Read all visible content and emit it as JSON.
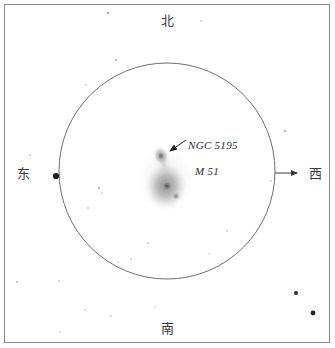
{
  "sketch": {
    "title": "M 51 telescopic field sketch",
    "directions": {
      "north": "北",
      "south": "南",
      "east": "东",
      "west": "西"
    },
    "objects": {
      "companion_label": "NGC 5195",
      "primary_label": "M 51"
    },
    "colors": {
      "frame": "#8a8a8a",
      "field_circle": "#6f6f6f",
      "ink": "#2b2b2b",
      "label": "#3a3a3a",
      "star": "#111111",
      "nebulosity": "#9a9a9a",
      "background": "#ffffff"
    },
    "field_circle": {
      "center_x": 167,
      "center_y": 171,
      "radius": 108
    },
    "drift_arrow": {
      "x_start": 275,
      "x_end": 300,
      "y": 173,
      "points_to": "西"
    },
    "leader_arrow": {
      "x_start": 186,
      "y_start": 140,
      "x_end": 168,
      "y_end": 153
    },
    "galaxy": {
      "primary": {
        "cx": 166,
        "cy": 186,
        "rx": 21,
        "ry": 24
      },
      "nucleus": {
        "cx": 167,
        "cy": 186,
        "r": 5
      },
      "arm_knot": {
        "cx": 176,
        "cy": 196,
        "r": 4
      },
      "bridge": {
        "cx": 164,
        "cy": 165,
        "rx": 7,
        "ry": 12
      },
      "companion": {
        "cx": 161,
        "cy": 156,
        "rx": 8,
        "ry": 10
      },
      "companion_core": {
        "cx": 161,
        "cy": 156,
        "r": 4
      }
    },
    "stars": [
      {
        "cx": 56,
        "cy": 176,
        "r": 3.1,
        "opacity": 0.95
      },
      {
        "cx": 296,
        "cy": 293,
        "r": 2.0,
        "opacity": 0.92
      },
      {
        "cx": 313,
        "cy": 313,
        "r": 2.4,
        "opacity": 0.92
      },
      {
        "cx": 108,
        "cy": 13,
        "r": 0.9,
        "opacity": 0.55
      },
      {
        "cx": 201,
        "cy": 21,
        "r": 0.7,
        "opacity": 0.4
      },
      {
        "cx": 116,
        "cy": 60,
        "r": 0.9,
        "opacity": 0.4
      },
      {
        "cx": 86,
        "cy": 85,
        "r": 0.8,
        "opacity": 0.32
      },
      {
        "cx": 285,
        "cy": 131,
        "r": 0.9,
        "opacity": 0.45
      },
      {
        "cx": 30,
        "cy": 155,
        "r": 0.8,
        "opacity": 0.35
      },
      {
        "cx": 99,
        "cy": 188,
        "r": 0.9,
        "opacity": 0.42
      },
      {
        "cx": 102,
        "cy": 193,
        "r": 0.7,
        "opacity": 0.35
      },
      {
        "cx": 88,
        "cy": 208,
        "r": 0.8,
        "opacity": 0.38
      },
      {
        "cx": 271,
        "cy": 181,
        "r": 0.8,
        "opacity": 0.33
      },
      {
        "cx": 148,
        "cy": 243,
        "r": 0.8,
        "opacity": 0.38
      },
      {
        "cx": 131,
        "cy": 259,
        "r": 0.8,
        "opacity": 0.35
      },
      {
        "cx": 118,
        "cy": 262,
        "r": 0.7,
        "opacity": 0.32
      },
      {
        "cx": 59,
        "cy": 281,
        "r": 0.8,
        "opacity": 0.35
      },
      {
        "cx": 17,
        "cy": 282,
        "r": 0.9,
        "opacity": 0.35
      },
      {
        "cx": 85,
        "cy": 310,
        "r": 0.8,
        "opacity": 0.33
      },
      {
        "cx": 111,
        "cy": 316,
        "r": 0.8,
        "opacity": 0.3
      },
      {
        "cx": 155,
        "cy": 307,
        "r": 0.7,
        "opacity": 0.3
      },
      {
        "cx": 60,
        "cy": 332,
        "r": 0.8,
        "opacity": 0.3
      },
      {
        "cx": 227,
        "cy": 231,
        "r": 0.8,
        "opacity": 0.33
      },
      {
        "cx": 209,
        "cy": 254,
        "r": 0.7,
        "opacity": 0.3
      }
    ]
  }
}
